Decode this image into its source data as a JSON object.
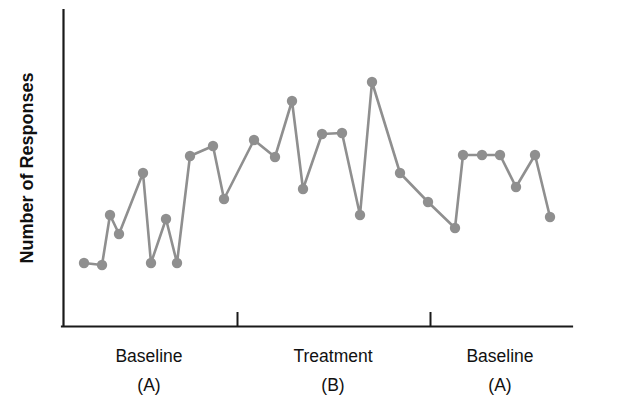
{
  "chart_data": {
    "type": "line",
    "title": "",
    "subtitle": "",
    "xlabel": "",
    "ylabel": "Number of Responses",
    "grid": false,
    "legend": "none",
    "axis_ranges": {
      "x": [
        0,
        36
      ],
      "y": [
        0,
        10
      ]
    },
    "axis_tick_labels": {
      "x": [],
      "y": []
    },
    "annotations": [],
    "phases": [
      {
        "name": "Baseline",
        "code": "(A)",
        "start_index": 0,
        "end_index": 9
      },
      {
        "name": "Treatment",
        "code": "(B)",
        "start_index": 10,
        "end_index": 22
      },
      {
        "name": "Baseline",
        "code": "(A)",
        "start_index": 23,
        "end_index": 33
      }
    ],
    "phase_divider_sessions": [
      10,
      23
    ],
    "series": [
      {
        "name": "Responses",
        "color": "#8f8f8f",
        "marker": "circle",
        "x": [
          1,
          2,
          3,
          4,
          5,
          6,
          7,
          8,
          9,
          10,
          11,
          12,
          13,
          14,
          15,
          16,
          17,
          18,
          19,
          20,
          21,
          22,
          23,
          24,
          25,
          26,
          27,
          28,
          29,
          30,
          31,
          32,
          33
        ],
        "values": [
          1.0,
          0.9,
          2.5,
          1.9,
          4.8,
          0.9,
          2.4,
          0.9,
          5.9,
          6.2,
          3.3,
          6.3,
          5.9,
          5.5,
          7.9,
          4.3,
          6.5,
          6.6,
          6.6,
          2.9,
          9.0,
          5.0,
          4.1,
          3.1,
          5.6,
          5.6,
          5.6,
          4.4,
          5.6,
          3.1,
          5.6,
          5.6,
          3.5
        ]
      }
    ],
    "pixel_points": [
      [
        84,
        263
      ],
      [
        102,
        265
      ],
      [
        110,
        215
      ],
      [
        119,
        234
      ],
      [
        143,
        173
      ],
      [
        151,
        263
      ],
      [
        166,
        219
      ],
      [
        177,
        263
      ],
      [
        190,
        156
      ],
      [
        213,
        146
      ],
      [
        224,
        199
      ],
      [
        254,
        140
      ],
      [
        275,
        157
      ],
      [
        292,
        101
      ],
      [
        303,
        189
      ],
      [
        322,
        134
      ],
      [
        342,
        133
      ],
      [
        360,
        215
      ],
      [
        372,
        82
      ],
      [
        400,
        173
      ],
      [
        428,
        202
      ],
      [
        455,
        228
      ],
      [
        463,
        155
      ],
      [
        482,
        155
      ],
      [
        500,
        155
      ],
      [
        516,
        187
      ],
      [
        535,
        155
      ],
      [
        550,
        217
      ]
    ]
  },
  "axes": {
    "y_title": "Number of Responses"
  },
  "phase_labels": [
    {
      "name": "Baseline",
      "code": "(A)",
      "x": 149
    },
    {
      "name": "Treatment",
      "code": "(B)",
      "x": 333
    },
    {
      "name": "Baseline",
      "code": "(A)",
      "x": 500
    }
  ],
  "colors": {
    "series": "#8f8f8f",
    "axis": "#1a1a1a",
    "text": "#111111",
    "background": "#ffffff"
  }
}
